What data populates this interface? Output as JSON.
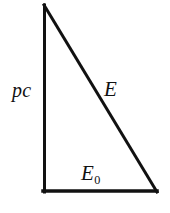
{
  "figure": {
    "name": "relativistic-energy-momentum-triangle",
    "background_color": "#ffffff",
    "stroke_color": "#111111",
    "stroke_width": 3,
    "width": 170,
    "height": 213
  },
  "diagram_data": {
    "type": "right-triangle",
    "vertices": {
      "apex": [
        43,
        5
      ],
      "bottom_left": [
        43,
        192
      ],
      "bottom_right": [
        157,
        192
      ]
    },
    "right_angle_at": "bottom_left",
    "edges": [
      {
        "id": "vertical-leg",
        "from": "apex",
        "to": "bottom_left",
        "label": "pc"
      },
      {
        "id": "horizontal-leg",
        "from": "bottom_left",
        "to": "bottom_right",
        "label": "E_0"
      },
      {
        "id": "hypotenuse",
        "from": "apex",
        "to": "bottom_right",
        "label": "E"
      }
    ]
  },
  "labels": {
    "vertical_leg": "pc",
    "hypotenuse": "E",
    "horizontal_leg_base": "E",
    "horizontal_leg_subscript": "0"
  }
}
